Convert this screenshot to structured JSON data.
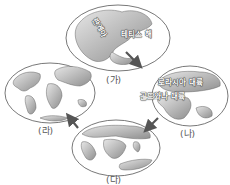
{
  "stages": [
    {
      "id": "ga",
      "label": "(가)",
      "places": [
        "판게아",
        "테티스 해"
      ]
    },
    {
      "id": "na",
      "label": "(나)",
      "places": [
        "로라시아 대륙",
        "곤드와나 대륙"
      ]
    },
    {
      "id": "da",
      "label": "(다)",
      "places": []
    },
    {
      "id": "ra",
      "label": "(라)",
      "places": []
    }
  ],
  "arrows": [
    {
      "from": "(가)",
      "to": "(나)"
    },
    {
      "from": "(나)",
      "to": "(다)"
    },
    {
      "from": "(다)",
      "to": "(라)"
    }
  ],
  "colors": {
    "land_light": "#d9d9d9",
    "land_dark": "#8a8a8a",
    "outline": "#555555",
    "arrow": "#555555"
  }
}
